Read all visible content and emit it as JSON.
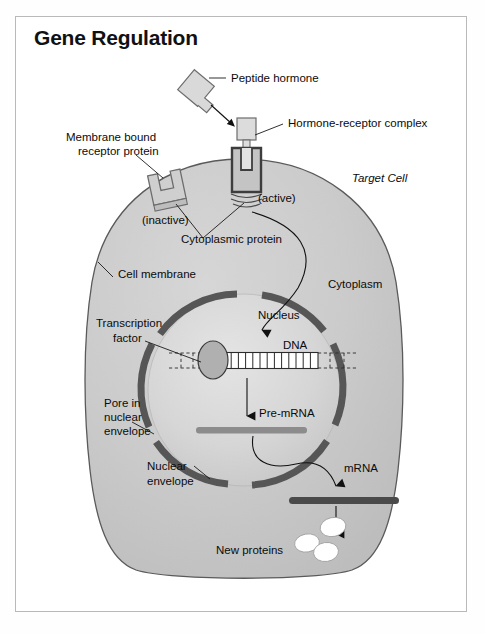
{
  "figure": {
    "title": "Gene Regulation",
    "domain_kind": "biology-diagram"
  },
  "colors": {
    "frame_border": "#b9b9b9",
    "page_background": "#ffffff",
    "cytoplasm_fill": "#c9c9c9",
    "cytoplasm_stroke": "#5a5a5a",
    "nucleus_fill": "#d8d8d8",
    "nuclear_envelope": "#565656",
    "protein_light": "#d9d9d9",
    "protein_stroke": "#6d6d6d",
    "receptor_active_stroke": "#3d3d3d",
    "pre_mrna_bar": "#8c8c8c",
    "mrna_bar": "#4a4a4a",
    "new_protein_fill": "#ffffff",
    "transcription_factor_fill": "#b0b0b0",
    "dna_fill": "#ffffff",
    "text": "#0b0b0b",
    "arrow": "#111111"
  },
  "labels": {
    "peptide_hormone": "Peptide hormone",
    "hormone_receptor_complex": "Hormone-receptor complex",
    "membrane_bound_receptor_line1": "Membrane bound",
    "membrane_bound_receptor_line2": "receptor protein",
    "inactive": "(inactive)",
    "active": "(active)",
    "cytoplasmic_protein": "Cytoplasmic protein",
    "target_cell": "Target Cell",
    "cell_membrane": "Cell membrane",
    "cytoplasm": "Cytoplasm",
    "nucleus": "Nucleus",
    "transcription_factor_line1": "Transcription",
    "transcription_factor_line2": "factor",
    "dna": "DNA",
    "pore_line1": "Pore in",
    "pore_line2": "nuclear",
    "pore_line3": "envelope",
    "pre_mrna": "Pre-mRNA",
    "nuclear_envelope_line1": "Nuclear",
    "nuclear_envelope_line2": "envelope",
    "mrna": "mRNA",
    "new_proteins": "New proteins"
  },
  "structures": {
    "dna_rung_count": 13,
    "new_protein_count": 3,
    "nuclear_envelope_pore_count": 4,
    "hormone_shape": "key-shaped peptide",
    "receptor_inactive_shape": "u-shaped notched block",
    "receptor_active_shape": "u-shaped block with hormone inserted"
  }
}
